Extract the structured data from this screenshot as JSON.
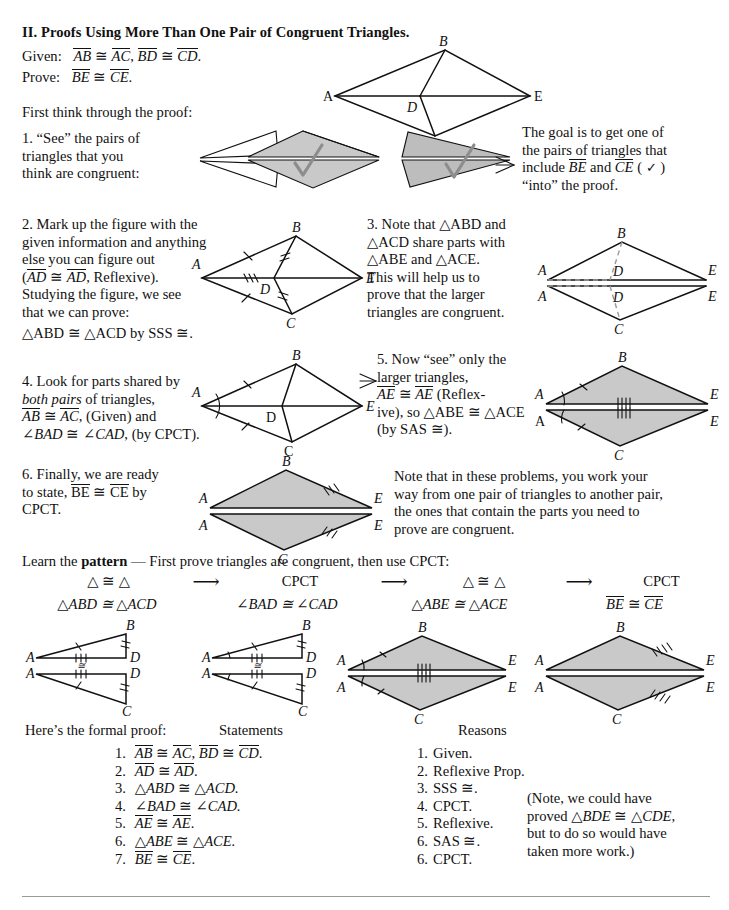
{
  "page": {
    "title": "II. Proofs Using More Than One Pair of Congruent Triangles.",
    "given_label": "Given:",
    "given_text": "AB ≅ AC, BD ≅ CD.",
    "prove_label": "Prove:",
    "prove_text": "BE ≅ CE.",
    "intro": "First think through the proof:"
  },
  "steps": [
    {
      "id": 1,
      "lines": [
        "1. “See” the pairs of",
        "triangles that you",
        "think are congruent:"
      ]
    },
    {
      "id": 2,
      "lines": [
        "2. Mark up the figure with the",
        "given information and anything",
        "else you can figure out",
        "(AD ≅ AD, Reflexive).",
        "Studying the figure, we see",
        "that we can prove:",
        "△ABD ≅ △ACD by SSS ≅."
      ]
    },
    {
      "id": 3,
      "lines": [
        "3. Note that △ABD and",
        "△ACD share parts with",
        "△ABE and △ACE.",
        "This will help us to",
        "prove that the larger",
        "triangles are congruent."
      ]
    },
    {
      "id": 4,
      "lines": [
        "4. Look for parts shared by",
        "both pairs of triangles,",
        "AB ≅ AC, (Given) and",
        "∠BAD ≅ ∠CAD, (by CPCT)."
      ]
    },
    {
      "id": 5,
      "lines": [
        "5. Now “see” only the",
        "larger triangles,",
        "AE ≅ AE (Reflex-",
        "ive), so △ABE ≅ △ACE",
        "(by SAS ≅)."
      ]
    },
    {
      "id": 6,
      "lines": [
        "6. Finally, we are ready",
        "to state, BE ≅ CE by",
        "CPCT."
      ]
    }
  ],
  "goal_note": {
    "lines": [
      "The goal is to get one of",
      "the pairs of triangles that",
      "include BE and  CE ( ✓ )",
      "“into” the proof."
    ]
  },
  "side_note": {
    "lines": [
      "Note that in these problems, you work your",
      "way from one pair of triangles to another pair,",
      "the ones that contain the parts you need to",
      "prove are congruent."
    ]
  },
  "pattern": {
    "lead_a": "Learn the ",
    "lead_bold": "pattern",
    "lead_b": " — First prove triangles are congruent, then use CPCT:",
    "arrow": "⟶",
    "headers": [
      "△ ≅ △",
      "CPCT",
      "△ ≅ △",
      "CPCT"
    ],
    "results": [
      "△ABD ≅ △ACD",
      "∠BAD ≅ ∠CAD",
      "△ABE ≅ △ACE",
      "BE ≅ CE"
    ]
  },
  "proof": {
    "intro": "Here’s the formal proof:",
    "statements_header": "Statements",
    "reasons_header": "Reasons",
    "statements": [
      {
        "n": "1.",
        "text": "AB ≅ AC, BD ≅ CD."
      },
      {
        "n": "2.",
        "text": "AD ≅ AD."
      },
      {
        "n": "3.",
        "text": "△ABD ≅ △ACD."
      },
      {
        "n": "4.",
        "text": "∠BAD ≅ ∠CAD."
      },
      {
        "n": "5.",
        "text": "AE ≅ AE."
      },
      {
        "n": "6.",
        "text": "△ABE ≅ △ACE."
      },
      {
        "n": "7.",
        "text": "BE ≅ CE."
      }
    ],
    "reasons": [
      {
        "n": "1.",
        "text": "Given."
      },
      {
        "n": "2.",
        "text": "Reflexive Prop."
      },
      {
        "n": "3.",
        "text": "SSS ≅."
      },
      {
        "n": "4.",
        "text": "CPCT."
      },
      {
        "n": "5.",
        "text": "Reflexive."
      },
      {
        "n": "6.",
        "text": "SAS ≅."
      },
      {
        "n": "6.",
        "text": "CPCT."
      }
    ],
    "aside": [
      "(Note, we could have",
      "proved △BDE ≅ △CDE,",
      "but to do so would have",
      "taken more work.)"
    ]
  },
  "figures": {
    "vertex_labels": [
      "A",
      "B",
      "C",
      "D",
      "E"
    ],
    "shade_color": "#c9c9c9",
    "line_color": "#111111",
    "dash_color": "#9a9a9a",
    "check_color": "#8d8d8d"
  }
}
